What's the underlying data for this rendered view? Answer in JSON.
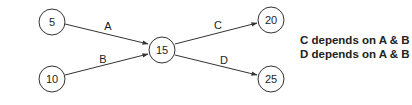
{
  "diagram": {
    "nodes": [
      {
        "id": "n5",
        "label": "5",
        "cx": 52,
        "cy": 22
      },
      {
        "id": "n10",
        "label": "10",
        "cx": 52,
        "cy": 79
      },
      {
        "id": "n15",
        "label": "15",
        "cx": 162,
        "cy": 50
      },
      {
        "id": "n20",
        "label": "20",
        "cx": 271,
        "cy": 20
      },
      {
        "id": "n25",
        "label": "25",
        "cx": 271,
        "cy": 79
      }
    ],
    "edges": [
      {
        "label": "A",
        "from": "5",
        "to": "15"
      },
      {
        "label": "B",
        "from": "10",
        "to": "15"
      },
      {
        "label": "C",
        "from": "15",
        "to": "20"
      },
      {
        "label": "D",
        "from": "15",
        "to": "25"
      }
    ],
    "notes": [
      "C depends on A & B",
      "D depends on A & B"
    ]
  }
}
